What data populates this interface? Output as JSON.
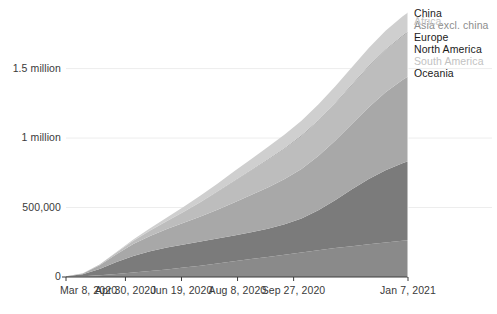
{
  "chart_data": {
    "type": "area",
    "stacked": true,
    "title": "",
    "subtitle": "",
    "xlabel": "",
    "ylabel": "",
    "grid": true,
    "legend_position": "right-inline",
    "ylim": [
      0,
      1900000
    ],
    "y_ticks": [
      {
        "value": 0,
        "label": "0"
      },
      {
        "value": 500000,
        "label": "500,000"
      },
      {
        "value": 1000000,
        "label": "1 million"
      },
      {
        "value": 1500000,
        "label": "1.5 million"
      }
    ],
    "x_ticks": [
      {
        "index": 0,
        "label": "Mar 8, 2020"
      },
      {
        "index": 53,
        "label": "Apr 30, 2020"
      },
      {
        "index": 103,
        "label": "Jun 19, 2020"
      },
      {
        "index": 153,
        "label": "Aug 8, 2020"
      },
      {
        "index": 203,
        "label": "Sep 27, 2020"
      },
      {
        "index": 305,
        "label": "Jan 7, 2021"
      }
    ],
    "x_domain": [
      0,
      305
    ],
    "x": [
      0,
      15,
      30,
      45,
      60,
      75,
      90,
      105,
      120,
      135,
      150,
      165,
      180,
      195,
      210,
      225,
      240,
      255,
      270,
      285,
      300,
      305
    ],
    "series": [
      {
        "name": "China",
        "color": "#6e6e6e",
        "label_tone": "dark",
        "values": [
          3100,
          3300,
          4600,
          4630,
          4640,
          4650,
          4660,
          4680,
          4700,
          4720,
          4740,
          4760,
          4780,
          4790,
          4800,
          4820,
          4840,
          4860,
          4880,
          4900,
          4920,
          4930
        ]
      },
      {
        "name": "Asia excl. china",
        "color": "#8a8a8a",
        "label_tone": "mid",
        "values": [
          700,
          2600,
          7800,
          16500,
          27000,
          38000,
          50000,
          63000,
          77000,
          92000,
          108000,
          124000,
          140000,
          156000,
          172000,
          188000,
          203000,
          217000,
          231000,
          244000,
          256000,
          260000
        ]
      },
      {
        "name": "Europe",
        "color": "#7b7b7b",
        "label_tone": "dark",
        "values": [
          1100,
          13000,
          46000,
          86000,
          120000,
          143000,
          158000,
          167000,
          174000,
          180000,
          186000,
          193000,
          203000,
          219000,
          245000,
          288000,
          345000,
          410000,
          470000,
          520000,
          558000,
          568000
        ]
      },
      {
        "name": "North America",
        "color": "#a8a8a8",
        "label_tone": "dark",
        "values": [
          400,
          6000,
          26000,
          57000,
          86000,
          110000,
          132000,
          155000,
          180000,
          208000,
          238000,
          268000,
          297000,
          326000,
          356000,
          390000,
          428000,
          470000,
          515000,
          560000,
          598000,
          610000
        ]
      },
      {
        "name": "South America",
        "color": "#bdbdbd",
        "label_tone": "light",
        "values": [
          100,
          900,
          4200,
          11000,
          22000,
          37000,
          56000,
          78000,
          102000,
          127000,
          152000,
          176000,
          198000,
          218000,
          236000,
          252000,
          266000,
          279000,
          292000,
          304000,
          314000,
          317000
        ]
      },
      {
        "name": "Oceania",
        "color": "#9c9c9c",
        "label_tone": "dark",
        "values": [
          30,
          200,
          700,
          1200,
          1500,
          1700,
          1900,
          2100,
          2400,
          2900,
          3600,
          4300,
          4900,
          5300,
          5600,
          5900,
          6200,
          6500,
          6800,
          7100,
          7400,
          7500
        ]
      },
      {
        "name": "Africa",
        "color": "#cfcfcf",
        "label_tone": "light",
        "values": [
          20,
          300,
          1500,
          4200,
          9000,
          16000,
          25000,
          35000,
          46000,
          57000,
          68000,
          78000,
          88000,
          97000,
          105000,
          112000,
          118000,
          123000,
          128000,
          132000,
          136000,
          137000
        ]
      }
    ]
  },
  "axis": {
    "axis_color": "#3a3a3a",
    "grid_color": "#ededed"
  }
}
